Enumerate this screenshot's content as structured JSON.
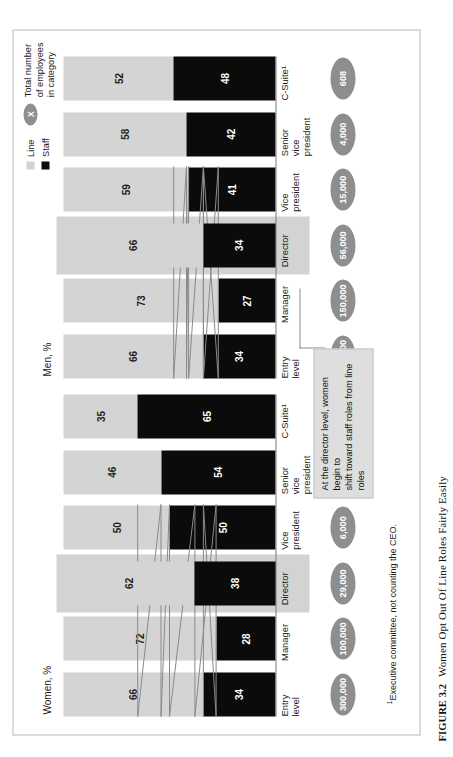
{
  "figure": {
    "number": "FIGURE 3.2",
    "title": "Women Opt Out Of Line Roles Fairly Easily"
  },
  "legend": {
    "line_label": "Line",
    "staff_label": "Staff",
    "total_marker": "X",
    "total_label": "Total number\nof employees\nin category",
    "line_color": "#d4d4d4",
    "staff_color": "#0b0b0b",
    "oval_color": "#8e8e8e"
  },
  "footnote": {
    "marker": "1",
    "text": "Executive committee, not counting the CEO."
  },
  "annotation": {
    "text": "At the director level, women begin to\nshift toward staff roles from line roles"
  },
  "panels": {
    "women": {
      "title": "Women, %"
    },
    "men": {
      "title": "Men, %"
    }
  },
  "chart_data": {
    "type": "bar",
    "title": "Women Opt Out Of Line Roles Fairly Easily",
    "subtype": "100% stacked bar, two panels",
    "categories": [
      "Entry\nlevel",
      "Manager",
      "Director",
      "Vice\npresident",
      "Senior\nvice\npresident",
      "C-Suite¹"
    ],
    "ylabel": "%",
    "ylim": [
      0,
      100
    ],
    "grid": false,
    "legend_position": "top-right",
    "highlight_category": "Director",
    "panels": [
      {
        "name": "Women, %",
        "series": [
          {
            "name": "Staff",
            "values": [
              34,
              28,
              38,
              50,
              54,
              65
            ]
          },
          {
            "name": "Line",
            "values": [
              66,
              72,
              62,
              50,
              46,
              35
            ]
          }
        ],
        "totals": [
          "300,000",
          "100,000",
          "29,000",
          "6,000",
          "1,000",
          "125"
        ]
      },
      {
        "name": "Men, %",
        "series": [
          {
            "name": "Staff",
            "values": [
              34,
              27,
              34,
              41,
              42,
              48
            ]
          },
          {
            "name": "Line",
            "values": [
              66,
              73,
              66,
              59,
              58,
              52
            ]
          }
        ],
        "totals": [
          "300,000",
          "150,000",
          "56,000",
          "15,000",
          "4,000",
          "608"
        ]
      }
    ]
  }
}
